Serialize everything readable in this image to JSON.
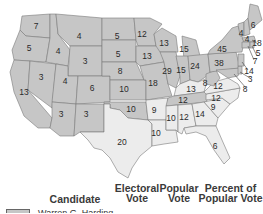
{
  "map": {
    "title_implied": "Election of 1920",
    "colors": {
      "harding": "#c6c6c6",
      "cox": "#ececec",
      "border": "#7a7a7a"
    },
    "states": [
      {
        "abbr": "WA",
        "votes": "7",
        "winner": "harding"
      },
      {
        "abbr": "OR",
        "votes": "5",
        "winner": "harding"
      },
      {
        "abbr": "CA",
        "votes": "13",
        "winner": "harding"
      },
      {
        "abbr": "ID",
        "votes": "4",
        "winner": "harding"
      },
      {
        "abbr": "NV",
        "votes": "3",
        "winner": "harding"
      },
      {
        "abbr": "MT",
        "votes": "4",
        "winner": "harding"
      },
      {
        "abbr": "WY",
        "votes": "3",
        "winner": "harding"
      },
      {
        "abbr": "UT",
        "votes": "4",
        "winner": "harding"
      },
      {
        "abbr": "AZ",
        "votes": "3",
        "winner": "harding"
      },
      {
        "abbr": "CO",
        "votes": "6",
        "winner": "harding"
      },
      {
        "abbr": "NM",
        "votes": "3",
        "winner": "harding"
      },
      {
        "abbr": "ND",
        "votes": "5",
        "winner": "harding"
      },
      {
        "abbr": "SD",
        "votes": "5",
        "winner": "harding"
      },
      {
        "abbr": "NE",
        "votes": "8",
        "winner": "harding"
      },
      {
        "abbr": "KS",
        "votes": "10",
        "winner": "harding"
      },
      {
        "abbr": "OK",
        "votes": "10",
        "winner": "harding"
      },
      {
        "abbr": "TX",
        "votes": "20",
        "winner": "cox"
      },
      {
        "abbr": "MN",
        "votes": "12",
        "winner": "harding"
      },
      {
        "abbr": "IA",
        "votes": "13",
        "winner": "harding"
      },
      {
        "abbr": "MO",
        "votes": "18",
        "winner": "harding"
      },
      {
        "abbr": "AR",
        "votes": "9",
        "winner": "cox"
      },
      {
        "abbr": "LA",
        "votes": "10",
        "winner": "cox"
      },
      {
        "abbr": "WI",
        "votes": "13",
        "winner": "harding"
      },
      {
        "abbr": "IL",
        "votes": "29",
        "winner": "harding"
      },
      {
        "abbr": "MI",
        "votes": "15",
        "winner": "harding"
      },
      {
        "abbr": "IN",
        "votes": "15",
        "winner": "harding"
      },
      {
        "abbr": "OH",
        "votes": "24",
        "winner": "harding"
      },
      {
        "abbr": "KY",
        "votes": "13",
        "winner": "cox"
      },
      {
        "abbr": "TN",
        "votes": "12",
        "winner": "harding"
      },
      {
        "abbr": "MS",
        "votes": "10",
        "winner": "cox"
      },
      {
        "abbr": "AL",
        "votes": "12",
        "winner": "cox"
      },
      {
        "abbr": "GA",
        "votes": "14",
        "winner": "cox"
      },
      {
        "abbr": "FL",
        "votes": "6",
        "winner": "cox"
      },
      {
        "abbr": "SC",
        "votes": "9",
        "winner": "cox"
      },
      {
        "abbr": "NC",
        "votes": "12",
        "winner": "cox"
      },
      {
        "abbr": "VA",
        "votes": "12",
        "winner": "cox"
      },
      {
        "abbr": "WV",
        "votes": "8",
        "winner": "harding"
      },
      {
        "abbr": "PA",
        "votes": "38",
        "winner": "harding"
      },
      {
        "abbr": "NY",
        "votes": "45",
        "winner": "harding"
      },
      {
        "abbr": "VT",
        "votes": "4",
        "winner": "harding"
      },
      {
        "abbr": "NH",
        "votes": "4",
        "winner": "harding"
      },
      {
        "abbr": "ME",
        "votes": "6",
        "winner": "harding"
      },
      {
        "abbr": "MA",
        "votes": "18",
        "winner": "harding"
      },
      {
        "abbr": "RI",
        "votes": "5",
        "winner": "harding"
      },
      {
        "abbr": "CT",
        "votes": "7",
        "winner": "harding"
      },
      {
        "abbr": "NJ",
        "votes": "14",
        "winner": "harding"
      },
      {
        "abbr": "DE",
        "votes": "3",
        "winner": "harding"
      },
      {
        "abbr": "MD",
        "votes": "8",
        "winner": "harding"
      }
    ]
  },
  "legend": {
    "headers": {
      "candidate": "Candidate",
      "electoral_vote": "Electoral Vote",
      "electoral_vote_line1": "Electoral",
      "electoral_vote_line2": "Vote",
      "popular_vote_line1": "Popular",
      "popular_vote_line2": "Vote",
      "percent_line1": "Percent of",
      "percent_line2": "Popular Vote"
    },
    "rows": [
      {
        "candidate": "Warren G. Harding",
        "color": "#c6c6c6"
      }
    ]
  }
}
